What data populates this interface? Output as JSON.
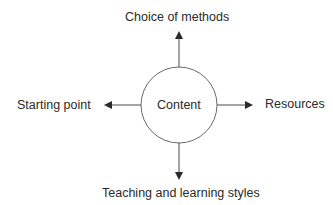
{
  "diagram": {
    "center": {
      "label": "Content"
    },
    "nodes": {
      "top": {
        "label": "Choice of methods"
      },
      "left": {
        "label": "Starting point"
      },
      "right": {
        "label": "Resources"
      },
      "bottom": {
        "label": "Teaching and learning styles"
      }
    },
    "colors": {
      "stroke": "#5a5a5a",
      "arrowhead": "#2a2a2a",
      "text": "#2a2a2a",
      "background": "#ffffff"
    }
  }
}
